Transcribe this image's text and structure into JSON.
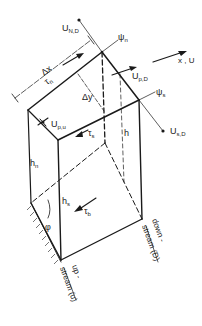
{
  "diagram": {
    "title": "",
    "labels": {
      "u_n_d": "U",
      "u_n_d_sub": "N,D",
      "psi_n": "ψ",
      "psi_n_sub": "n",
      "x_u": "x , U",
      "delta_x": "Δx",
      "tau_n": "τ",
      "tau_n_sub": "n",
      "u_p_d": "U",
      "u_p_d_sub": "p,D",
      "delta_y": "Δy",
      "psi_s": "ψ",
      "psi_s_sub": "s",
      "u_p_u": "U",
      "u_p_u_sub": "p,u",
      "tau_s": "τ",
      "tau_s_sub": "s",
      "h": "h",
      "u_s_d": "U",
      "u_s_d_sub": "s,D",
      "h_n": "h",
      "h_n_sub": "n",
      "h_s": "h",
      "h_s_sub": "s",
      "tau_b": "τ",
      "tau_b_sub": "b",
      "phi": "φ",
      "downstream_1": "down -",
      "downstream_2": "stream (D)",
      "upstream_1": "up -",
      "upstream_2": "stream (u)"
    }
  }
}
